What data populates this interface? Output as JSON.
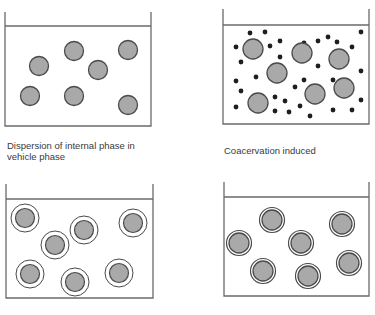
{
  "panels": [
    {
      "id": "dispersion",
      "label": "Dispersion of internal phase in vehicle phase",
      "label_lines": [
        "Dispersion of internal phase in",
        "vehicle phase"
      ],
      "box": {
        "x": 5,
        "wall_top": 12,
        "water": 26,
        "right": 151,
        "bottom": 126
      },
      "droplets": [
        {
          "cx": 39,
          "cy": 66
        },
        {
          "cx": 74,
          "cy": 51
        },
        {
          "cx": 98,
          "cy": 70
        },
        {
          "cx": 128,
          "cy": 50
        },
        {
          "cx": 30,
          "cy": 96
        },
        {
          "cx": 74,
          "cy": 96
        },
        {
          "cx": 128,
          "cy": 105
        }
      ]
    },
    {
      "id": "coacervation",
      "label": "Coacervation induced",
      "box": {
        "x": 223,
        "wall_top": 9,
        "water": 25,
        "right": 369,
        "bottom": 124
      },
      "droplets": [
        {
          "cx": 253,
          "cy": 49
        },
        {
          "cx": 302,
          "cy": 53
        },
        {
          "cx": 339,
          "cy": 59
        },
        {
          "cx": 277,
          "cy": 73
        },
        {
          "cx": 315,
          "cy": 94
        },
        {
          "cx": 344,
          "cy": 88
        },
        {
          "cx": 258,
          "cy": 103
        }
      ],
      "coacervate_dots": [
        [
          250,
          33
        ],
        [
          265,
          32
        ],
        [
          236,
          47
        ],
        [
          270,
          46
        ],
        [
          280,
          41
        ],
        [
          241,
          62
        ],
        [
          280,
          57
        ],
        [
          256,
          77
        ],
        [
          236,
          81
        ],
        [
          241,
          91
        ],
        [
          236,
          107
        ],
        [
          275,
          97
        ],
        [
          285,
          101
        ],
        [
          275,
          111
        ],
        [
          295,
          87
        ],
        [
          300,
          106
        ],
        [
          289,
          112
        ],
        [
          310,
          116
        ],
        [
          304,
          80
        ],
        [
          304,
          43
        ],
        [
          318,
          41
        ],
        [
          328,
          37
        ],
        [
          337,
          42
        ],
        [
          352,
          47
        ],
        [
          318,
          66
        ],
        [
          333,
          80
        ],
        [
          361,
          32
        ],
        [
          361,
          71
        ],
        [
          361,
          100
        ],
        [
          333,
          110
        ],
        [
          352,
          110
        ]
      ]
    },
    {
      "id": "coating",
      "label": "",
      "box": {
        "x": 6,
        "wall_top": 184,
        "water": 199,
        "right": 153,
        "bottom": 298
      },
      "droplets": [
        {
          "cx": 25,
          "cy": 218
        },
        {
          "cx": 55,
          "cy": 245
        },
        {
          "cx": 84,
          "cy": 230
        },
        {
          "cx": 133,
          "cy": 223
        },
        {
          "cx": 30,
          "cy": 274
        },
        {
          "cx": 75,
          "cy": 282
        },
        {
          "cx": 119,
          "cy": 273
        }
      ]
    },
    {
      "id": "wall-solidification",
      "label": "",
      "box": {
        "x": 224,
        "wall_top": 182,
        "water": 197,
        "right": 369,
        "bottom": 296
      },
      "droplets": [
        {
          "cx": 272,
          "cy": 220
        },
        {
          "cx": 342,
          "cy": 224
        },
        {
          "cx": 239,
          "cy": 243
        },
        {
          "cx": 301,
          "cy": 243
        },
        {
          "cx": 263,
          "cy": 271
        },
        {
          "cx": 308,
          "cy": 276
        },
        {
          "cx": 349,
          "cy": 263
        }
      ]
    }
  ],
  "colors": {
    "line": "#6a6a6a",
    "droplet_fill": "#a9a9a9",
    "droplet_stroke": "#4a4a4a",
    "dot": "#1e1e1e",
    "text": "#3a3a3a"
  }
}
